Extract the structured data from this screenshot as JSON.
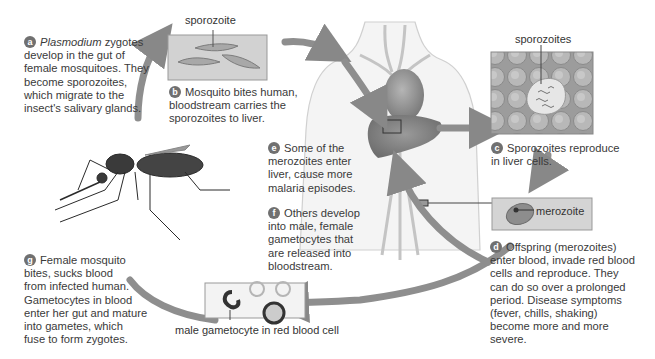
{
  "steps": [
    {
      "id": "a",
      "pre_italic": "Plasmodium",
      "text_lines": [
        " zygotes",
        "develop in the gut of",
        "female mosquitoes. They",
        "become sporozoites,",
        "which migrate to the",
        "insect's salivary glands."
      ]
    },
    {
      "id": "b",
      "text_lines": [
        "Mosquito bites human,",
        "bloodstream carries the",
        "sporozoites to liver."
      ]
    },
    {
      "id": "c",
      "text_lines": [
        "Sporozoites reproduce",
        "in liver cells."
      ]
    },
    {
      "id": "d",
      "text_lines": [
        "Offspring (merozoites)",
        "enter blood, invade red blood",
        "cells and reproduce. They",
        "can do so over a prolonged",
        "period. Disease  symptoms",
        "(fever, chills, shaking)",
        "become more and more",
        "severe."
      ]
    },
    {
      "id": "e",
      "text_lines": [
        "Some of the",
        "merozoites enter",
        "liver, cause more",
        "malaria episodes."
      ]
    },
    {
      "id": "f",
      "text_lines": [
        "Others develop",
        "into male, female",
        "gametocytes that",
        "are released into",
        "bloodstream."
      ]
    },
    {
      "id": "g",
      "text_lines": [
        "Female mosquito",
        "bites, sucks blood",
        "from infected human.",
        "Gametocytes in blood",
        "enter her gut and mature",
        "into gametes, which",
        "fuse to form zygotes."
      ]
    }
  ],
  "labels": {
    "sporozoite": "sporozoite",
    "sporozoites": "sporozoites",
    "merozoite": "merozoite",
    "male_gametocyte": "male gametocyte in red blood cell"
  },
  "colors": {
    "arrow": "#8c8c8c",
    "badge": "#707070",
    "text": "#3a3a3a",
    "panel_bg": "#d4d4d4",
    "body_outline": "#cfcfcf"
  }
}
